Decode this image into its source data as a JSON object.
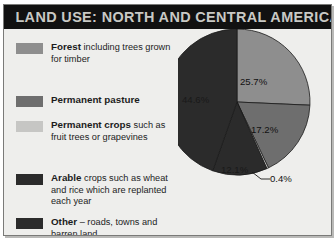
{
  "title": "LAND USE: NORTH AND CENTRAL AMERICA",
  "colors": {
    "title_bar": "#111111",
    "title_text": "#c9c9c5",
    "panel": "#eeeeec",
    "forest": "#8e8e8e",
    "pasture": "#6e6e6e",
    "crops": "#c6c6c4",
    "arable": "#2b2b2b",
    "other": "#2b2b2b",
    "outline": "#1a1a1a"
  },
  "legend": {
    "items": [
      {
        "key": "forest",
        "name": "forest",
        "bold": "Forest",
        "rest": " including trees grown for timber",
        "swatch": "#8e8e8e"
      },
      {
        "key": "pasture",
        "name": "permanent-pasture",
        "bold": "Permanent pasture",
        "rest": "",
        "swatch": "#6e6e6e"
      },
      {
        "key": "crops",
        "name": "permanent-crops",
        "bold": "Permanent crops",
        "rest": " such as fruit trees or grapevines",
        "swatch": "#c6c6c4"
      },
      {
        "key": "arable",
        "name": "arable",
        "bold": "Arable",
        "rest": " crops such as wheat and rice which are replanted each year",
        "swatch": "#2b2b2b"
      },
      {
        "key": "other",
        "name": "other",
        "bold": "Other",
        "rest": " – roads, towns and barren land",
        "swatch": "#2b2b2b"
      }
    ]
  },
  "chart_data": {
    "type": "pie",
    "title": "LAND USE: NORTH AND CENTRAL AMERICA",
    "legend_position": "left",
    "start_angle": 0,
    "direction": "clockwise",
    "categories": [
      "Forest",
      "Permanent pasture",
      "Permanent crops",
      "Arable",
      "Other"
    ],
    "values": [
      25.7,
      17.2,
      0.4,
      12.1,
      44.6
    ],
    "labels": [
      "25.7%",
      "17.2%",
      "0.4%",
      "12.1%",
      "44.6%"
    ],
    "colors": [
      "#8e8e8e",
      "#6e6e6e",
      "#c6c6c4",
      "#2b2b2b",
      "#2b2b2b"
    ],
    "unit": "%"
  }
}
